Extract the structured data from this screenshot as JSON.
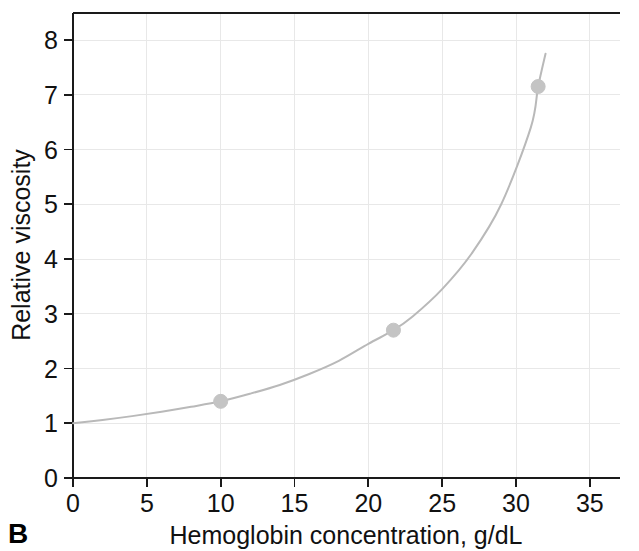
{
  "figure": {
    "panel_label": "B"
  },
  "chart_data": {
    "type": "line",
    "title": "",
    "xlabel": "Hemoglobin concentration, g/dL",
    "ylabel": "Relative viscosity",
    "xlim": [
      0,
      37
    ],
    "ylim": [
      0,
      8.5
    ],
    "xticks": [
      0,
      5,
      10,
      15,
      20,
      25,
      30,
      35
    ],
    "xticklabels": [
      "0",
      "5",
      "10",
      "15",
      "20",
      "25",
      "30",
      "35"
    ],
    "yticks": [
      0,
      1,
      2,
      3,
      4,
      5,
      6,
      7,
      8
    ],
    "yticklabels": [
      "0",
      "1",
      "2",
      "3",
      "4",
      "5",
      "6",
      "7",
      "8"
    ],
    "grid": true,
    "grid_color": "#e8e8e8",
    "legend": null,
    "series": [
      {
        "name": "Relative viscosity",
        "kind": "curve",
        "color": "#b9b9b9",
        "line_width": 2.0,
        "x": [
          0,
          2,
          4,
          6,
          8,
          10,
          12,
          14,
          16,
          18,
          20,
          21.7,
          23,
          25,
          27,
          29,
          31,
          31.5,
          32
        ],
        "y": [
          1.0,
          1.06,
          1.13,
          1.21,
          1.3,
          1.4,
          1.54,
          1.7,
          1.9,
          2.14,
          2.45,
          2.7,
          2.95,
          3.45,
          4.1,
          5.0,
          6.4,
          7.15,
          7.75
        ]
      },
      {
        "name": "Measured points",
        "kind": "markers",
        "color": "#c4c4c4",
        "marker_radius": 7,
        "x": [
          10.0,
          21.7,
          31.5
        ],
        "y": [
          1.4,
          2.7,
          7.15
        ]
      }
    ]
  },
  "colors": {
    "axis": "#1a1a1a",
    "text": "#111111",
    "grid": "#e8e8e8",
    "curve": "#b9b9b9",
    "marker": "#c4c4c4",
    "background": "#ffffff"
  }
}
